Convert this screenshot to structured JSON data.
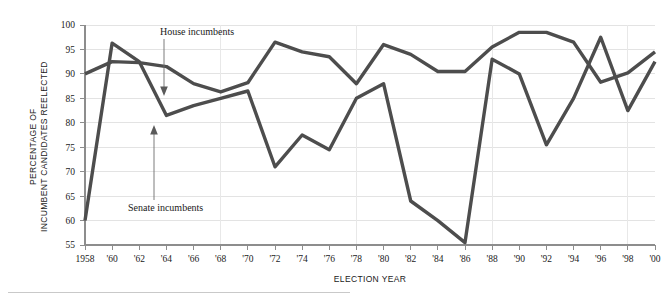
{
  "chart_data": {
    "type": "line",
    "title": "",
    "xlabel": "ELECTION YEAR",
    "ylabel_line1": "PERCENTAGE OF",
    "ylabel_line2": "INCUMBENT CANDIDATES REELECTED",
    "ylabel_full": "PERCENTAGE OF INCUMBENT CANDIDATES REELECTED",
    "grid": true,
    "legend_position": "inline-annotations",
    "ylim": [
      55,
      100
    ],
    "ytick_labels": [
      "100",
      "95",
      "90",
      "85",
      "80",
      "75",
      "70",
      "65",
      "60",
      "55"
    ],
    "yticks": [
      100,
      95,
      90,
      85,
      80,
      75,
      70,
      65,
      60,
      55
    ],
    "categories": [
      1958,
      1960,
      1962,
      1964,
      1966,
      1968,
      1970,
      1972,
      1974,
      1976,
      1978,
      1980,
      1982,
      1984,
      1986,
      1988,
      1990,
      1992,
      1994,
      1996,
      1998,
      2000
    ],
    "xtick_labels": [
      "1958",
      "'60",
      "'62",
      "'64",
      "'66",
      "'68",
      "'70",
      "'72",
      "'74",
      "'76",
      "'78",
      "'80",
      "'82",
      "'84",
      "'86",
      "'88",
      "'90",
      "'92",
      "'94",
      "'96",
      "'98",
      "'00"
    ],
    "series": [
      {
        "name": "House incumbents",
        "color": "#4d4d4d",
        "values": [
          90.0,
          92.5,
          92.3,
          91.5,
          88.0,
          86.3,
          88.2,
          96.5,
          94.5,
          93.5,
          88.0,
          96.0,
          94.0,
          90.5,
          90.5,
          95.5,
          98.5,
          98.5,
          96.5,
          88.3,
          90.2,
          94.5
        ]
      },
      {
        "name": "Senate incumbents",
        "color": "#4d4d4d",
        "values": [
          60.0,
          96.3,
          92.5,
          81.5,
          83.5,
          85.0,
          86.5,
          71.0,
          77.5,
          74.5,
          85.0,
          88.0,
          64.0,
          60.0,
          55.5,
          93.0,
          90.0,
          75.5,
          85.0,
          97.5,
          82.5,
          92.5
        ]
      }
    ],
    "series_extended_note": "",
    "annotations": [
      {
        "label": "House incumbents",
        "target_year": 1968,
        "target_value": 86.3
      },
      {
        "label": "Senate incumbents",
        "target_year": 1964,
        "target_value": 81.5
      }
    ]
  },
  "house_points": [
    {
      "year": 1958,
      "value": 90.0
    },
    {
      "year": 1960,
      "value": 92.5
    },
    {
      "year": 1962,
      "value": 92.3
    },
    {
      "year": 1964,
      "value": 91.5
    },
    {
      "year": 1966,
      "value": 88.0
    },
    {
      "year": 1968,
      "value": 86.3
    },
    {
      "year": 1970,
      "value": 88.2
    },
    {
      "year": 1972,
      "value": 96.5
    },
    {
      "year": 1974,
      "value": 94.5
    },
    {
      "year": 1976,
      "value": 93.5
    },
    {
      "year": 1978,
      "value": 88.0
    },
    {
      "year": 1980,
      "value": 96.0
    },
    {
      "year": 1982,
      "value": 94.0
    },
    {
      "year": 1984,
      "value": 90.5
    },
    {
      "year": 1986,
      "value": 90.5
    },
    {
      "year": 1988,
      "value": 95.5
    },
    {
      "year": 1990,
      "value": 98.5
    },
    {
      "year": 1992,
      "value": 98.5
    },
    {
      "year": 1994,
      "value": 96.5
    },
    {
      "year": 1996,
      "value": 88.3
    },
    {
      "year": 1998,
      "value": 90.2
    },
    {
      "year": 2000,
      "value": 94.5
    }
  ],
  "senate_points": [
    {
      "year": 1958,
      "value": 60.0
    },
    {
      "year": 1960,
      "value": 96.3
    },
    {
      "year": 1962,
      "value": 92.5
    },
    {
      "year": 1964,
      "value": 81.5
    },
    {
      "year": 1966,
      "value": 83.5
    },
    {
      "year": 1968,
      "value": 85.0
    },
    {
      "year": 1970,
      "value": 86.5
    },
    {
      "year": 1972,
      "value": 71.0
    },
    {
      "year": 1974,
      "value": 77.5
    },
    {
      "year": 1976,
      "value": 74.5
    },
    {
      "year": 1978,
      "value": 85.0
    },
    {
      "year": 1980,
      "value": 88.0
    },
    {
      "year": 1982,
      "value": 64.0
    },
    {
      "year": 1984,
      "value": 60.0
    },
    {
      "year": 1986,
      "value": 55.5
    },
    {
      "year": 1988,
      "value": 93.0
    },
    {
      "year": 1990,
      "value": 90.0
    },
    {
      "year": 1992,
      "value": 75.5
    },
    {
      "year": 1994,
      "value": 85.0
    },
    {
      "year": 1996,
      "value": 97.5
    },
    {
      "year": 1998,
      "value": 82.5
    },
    {
      "year": 2000,
      "value": 92.5
    }
  ],
  "colors": {
    "line": "#4d4d4d",
    "grid": "#e3e3e3",
    "axis": "#8d8d8d",
    "text": "#1a1a1a",
    "background": "#ffffff"
  }
}
